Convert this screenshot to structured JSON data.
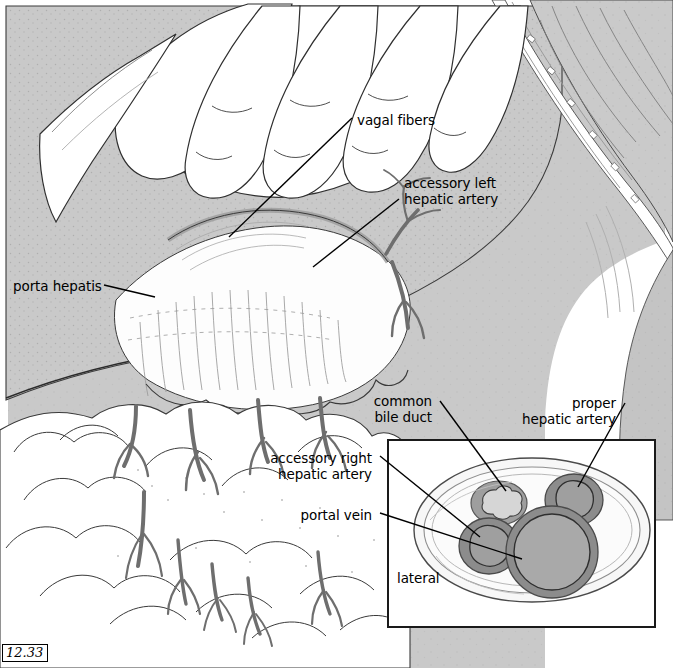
{
  "figure": {
    "number": "12.33",
    "background": "#ffffff"
  },
  "palette": {
    "liver_gray": "#c9c9c9",
    "liver_gray_dark": "#b4b4b4",
    "tissue_light": "#f2f2f2",
    "white_tissue": "#fdfdfd",
    "vessel_dark": "#6e6e6e",
    "vessel_wall": "#8c8c8c",
    "vessel_lumen": "#a9a9a9",
    "duct_lumen": "#d4d4d4",
    "outline": "#2b2b2b",
    "leader_line": "#000000"
  },
  "labels": [
    {
      "id": "vagal-fibers",
      "text": "vagal fibers",
      "x": 357,
      "y": 113,
      "align": "left"
    },
    {
      "id": "accessory-left-hepatic",
      "text": "accessory left\nhepatic artery",
      "x": 404,
      "y": 176,
      "align": "left"
    },
    {
      "id": "porta-hepatis",
      "text": "porta hepatis",
      "x": 13,
      "y": 279,
      "align": "left"
    },
    {
      "id": "common-bile-duct",
      "text": "common\nbile duct",
      "x": 432,
      "y": 394,
      "align": "right"
    },
    {
      "id": "proper-hepatic-artery",
      "text": "proper\nhepatic artery",
      "x": 616,
      "y": 396,
      "align": "right"
    },
    {
      "id": "accessory-right-hepatic",
      "text": "accessory right\nhepatic artery",
      "x": 372,
      "y": 451,
      "align": "right"
    },
    {
      "id": "portal-vein",
      "text": "portal vein",
      "x": 372,
      "y": 508,
      "align": "right"
    },
    {
      "id": "lateral",
      "text": "lateral",
      "x": 397,
      "y": 571,
      "align": "left"
    }
  ],
  "inset": {
    "name": "cross-section-of-hepatoduodenal-ligament",
    "box": {
      "x": 388,
      "y": 440,
      "width": 267,
      "height": 187
    },
    "orientation_label": "lateral",
    "structures": [
      {
        "id": "common-bile-duct-cs",
        "label": "common bile duct",
        "cx": 499,
        "cy": 503,
        "rx": 27,
        "ry": 21,
        "wall": "#9a9a9a",
        "lumen": "#d4d4d4",
        "shape": "scalloped"
      },
      {
        "id": "proper-hepatic-artery-cs",
        "label": "proper hepatic artery",
        "cx": 573,
        "cy": 500,
        "rx": 28,
        "ry": 25,
        "wall": "#8c8c8c",
        "lumen": "#9e9e9e",
        "shape": "round"
      },
      {
        "id": "accessory-right-hepatic-cs",
        "label": "accessory right hepatic artery",
        "cx": 489,
        "cy": 545,
        "rx": 29,
        "ry": 27,
        "wall": "#8c8c8c",
        "lumen": "#9e9e9e",
        "shape": "round"
      },
      {
        "id": "portal-vein-cs",
        "label": "portal vein",
        "cx": 551,
        "cy": 551,
        "rx": 45,
        "ry": 44,
        "wall": "#8c8c8c",
        "lumen": "#a9a9a9",
        "shape": "round"
      }
    ]
  },
  "leaders": [
    {
      "id": "leader-vagal-fibers",
      "from": [
        352,
        118
      ],
      "to": [
        229,
        237
      ]
    },
    {
      "id": "leader-accessory-left-hepatic",
      "from": [
        399,
        198
      ],
      "to": [
        313,
        266
      ]
    },
    {
      "id": "leader-porta-hepatis",
      "from": [
        104,
        286
      ],
      "to": [
        152,
        296
      ]
    },
    {
      "id": "leader-common-bile-duct",
      "from": [
        440,
        400
      ],
      "to": [
        508,
        490
      ]
    },
    {
      "id": "leader-proper-hepatic-artery",
      "from": [
        623,
        402
      ],
      "to": [
        578,
        487
      ]
    },
    {
      "id": "leader-accessory-right-hepatic",
      "from": [
        380,
        456
      ],
      "to": [
        479,
        536
      ]
    },
    {
      "id": "leader-portal-vein",
      "from": [
        380,
        513
      ],
      "to": [
        521,
        558
      ]
    }
  ],
  "scene": {
    "regions": [
      {
        "id": "retracted-liver",
        "tone": "liver_gray"
      },
      {
        "id": "surgeons-hand",
        "tone": "white_tissue",
        "fingers": 4
      },
      {
        "id": "abdominal-wall-right",
        "tone": "liver_gray"
      },
      {
        "id": "ribcage-retractor-band",
        "tone": "white_tissue"
      },
      {
        "id": "lesser-omentum",
        "tone": "white_tissue"
      },
      {
        "id": "greater-omentum",
        "tone": "white_tissue"
      },
      {
        "id": "omental-vessels",
        "tone": "vessel_dark",
        "count": 12
      }
    ]
  }
}
